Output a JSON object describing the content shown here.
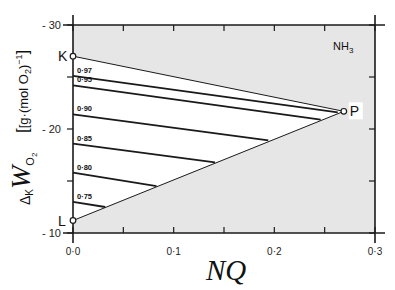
{
  "chart_data": {
    "type": "line",
    "title": "",
    "annotation_species": "NH3",
    "xlabel": "NQ",
    "ylabel": "ΔK WO2 [g·(mol O2)^-1]",
    "xlim": [
      0.0,
      0.3
    ],
    "ylim": [
      10,
      30
    ],
    "x_ticks": [
      0.0,
      0.05,
      0.1,
      0.15,
      0.2,
      0.25,
      0.3
    ],
    "x_tick_labels": [
      "0·0",
      "",
      "0·1",
      "",
      "0·2",
      "",
      "0·3"
    ],
    "y_ticks": [
      10,
      15,
      20,
      25,
      30
    ],
    "y_tick_labels": [
      "10",
      "",
      "20",
      "",
      "30"
    ],
    "grid": false,
    "shaded_region": "area outside triangle K-P-L (light gray)",
    "points": [
      {
        "name": "K",
        "x": 0.0,
        "y": 27.0
      },
      {
        "name": "P",
        "x": 0.269,
        "y": 21.7
      },
      {
        "name": "L",
        "x": 0.0,
        "y": 11.2
      }
    ],
    "boundary_lines": [
      {
        "from": "K",
        "to": "P"
      },
      {
        "from": "L",
        "to": "P"
      }
    ],
    "series": [
      {
        "name": "0·97",
        "x": [
          0.0,
          0.263
        ],
        "y": [
          25.1,
          21.6
        ]
      },
      {
        "name": "0·95",
        "x": [
          0.0,
          0.246
        ],
        "y": [
          24.2,
          20.9
        ]
      },
      {
        "name": "0·90",
        "x": [
          0.0,
          0.194
        ],
        "y": [
          21.4,
          18.9
        ]
      },
      {
        "name": "0·85",
        "x": [
          0.0,
          0.141
        ],
        "y": [
          18.6,
          16.8
        ]
      },
      {
        "name": "0·80",
        "x": [
          0.0,
          0.083
        ],
        "y": [
          15.8,
          14.5
        ]
      },
      {
        "name": "0·75",
        "x": [
          0.0,
          0.032
        ],
        "y": [
          13.0,
          12.5
        ]
      }
    ]
  },
  "labels": {
    "species": "NH",
    "species_sub": "3",
    "xlabel": "NQ",
    "ylabel_delta": "Δ",
    "ylabel_k": "K",
    "ylabel_w": "W",
    "ylabel_o2": "O",
    "ylabel_o2_sub": "2",
    "ylabel_units_open": "[g·(mol O",
    "ylabel_units_sub": "2",
    "ylabel_units_close": ")",
    "ylabel_units_sup": "−1",
    "ylabel_units_bracket": "]"
  },
  "colors": {
    "shade": "#e6e6e6",
    "line": "#1a1a1a",
    "background": "#ffffff"
  }
}
